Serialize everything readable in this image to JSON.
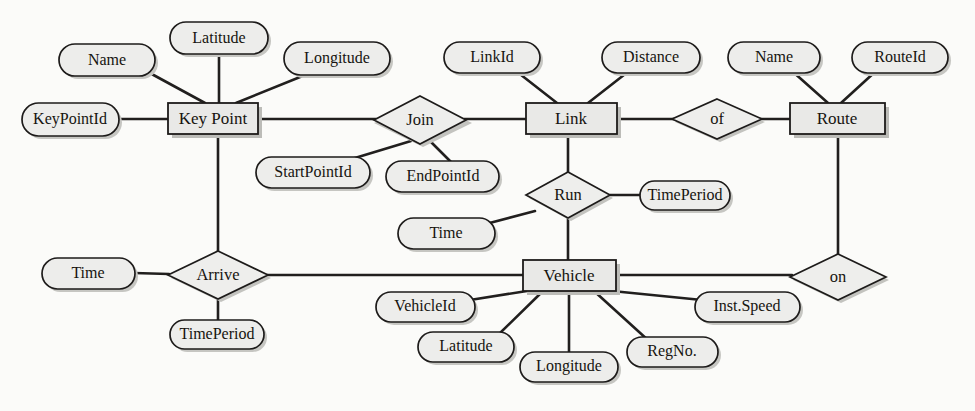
{
  "diagram": {
    "type": "entity-relationship-diagram",
    "title": "",
    "entities": [
      {
        "id": "key_point",
        "label": "Key Point",
        "x": 168,
        "y": 103,
        "w": 90,
        "h": 31
      },
      {
        "id": "link",
        "label": "Link",
        "x": 526,
        "y": 103,
        "w": 91,
        "h": 31
      },
      {
        "id": "route",
        "label": "Route",
        "x": 790,
        "y": 103,
        "w": 95,
        "h": 31
      },
      {
        "id": "vehicle",
        "label": "Vehicle",
        "x": 523,
        "y": 260,
        "w": 93,
        "h": 31
      }
    ],
    "relationships": [
      {
        "id": "join",
        "label": "Join",
        "cx": 420,
        "cy": 120,
        "rx": 46,
        "ry": 24
      },
      {
        "id": "of",
        "label": "of",
        "cx": 717,
        "cy": 119,
        "rx": 45,
        "ry": 20
      },
      {
        "id": "run",
        "label": "Run",
        "cx": 568,
        "cy": 195,
        "rx": 42,
        "ry": 23
      },
      {
        "id": "arrive",
        "label": "Arrive",
        "cx": 218,
        "cy": 275,
        "rx": 50,
        "ry": 24
      },
      {
        "id": "on",
        "label": "on",
        "cx": 838,
        "cy": 277,
        "rx": 48,
        "ry": 23
      }
    ],
    "attributes": [
      {
        "id": "kp_name",
        "label": "Name",
        "owner": "key_point",
        "cx": 107,
        "cy": 60,
        "rx": 48,
        "ry": 16
      },
      {
        "id": "kp_latitude",
        "label": "Latitude",
        "owner": "key_point",
        "cx": 219,
        "cy": 38,
        "rx": 49,
        "ry": 16
      },
      {
        "id": "kp_longitude",
        "label": "Longitude",
        "owner": "key_point",
        "cx": 337,
        "cy": 59,
        "rx": 53,
        "ry": 17
      },
      {
        "id": "kp_keypointid",
        "label": "KeyPointId",
        "owner": "key_point",
        "cx": 70,
        "cy": 119,
        "rx": 49,
        "ry": 17
      },
      {
        "id": "join_startpointid",
        "label": "StartPointId",
        "owner": "join",
        "cx": 313,
        "cy": 173,
        "rx": 57,
        "ry": 16
      },
      {
        "id": "join_endpointid",
        "label": "EndPointId",
        "owner": "join",
        "cx": 443,
        "cy": 177,
        "rx": 57,
        "ry": 16
      },
      {
        "id": "link_linkid",
        "label": "LinkId",
        "owner": "link",
        "cx": 492,
        "cy": 57,
        "rx": 48,
        "ry": 16
      },
      {
        "id": "link_distance",
        "label": "Distance",
        "owner": "link",
        "cx": 651,
        "cy": 57,
        "rx": 49,
        "ry": 16
      },
      {
        "id": "route_name",
        "label": "Name",
        "owner": "route",
        "cx": 774,
        "cy": 57,
        "rx": 46,
        "ry": 16
      },
      {
        "id": "route_routeid",
        "label": "RouteId",
        "owner": "route",
        "cx": 900,
        "cy": 57,
        "rx": 48,
        "ry": 16
      },
      {
        "id": "run_timeperiod",
        "label": "TimePeriod",
        "owner": "run",
        "cx": 685,
        "cy": 196,
        "rx": 45,
        "ry": 15
      },
      {
        "id": "run_time",
        "label": "Time",
        "owner": "run",
        "cx": 446,
        "cy": 233,
        "rx": 48,
        "ry": 16
      },
      {
        "id": "arrive_time",
        "label": "Time",
        "owner": "arrive",
        "cx": 88,
        "cy": 273,
        "rx": 46,
        "ry": 16
      },
      {
        "id": "arrive_timeperiod",
        "label": "TimePeriod",
        "owner": "arrive",
        "cx": 217,
        "cy": 335,
        "rx": 47,
        "ry": 15
      },
      {
        "id": "veh_vehicleid",
        "label": "VehicleId",
        "owner": "vehicle",
        "cx": 425,
        "cy": 307,
        "rx": 49,
        "ry": 15
      },
      {
        "id": "veh_latitude",
        "label": "Latitude",
        "owner": "vehicle",
        "cx": 466,
        "cy": 347,
        "rx": 48,
        "ry": 15
      },
      {
        "id": "veh_longitude",
        "label": "Longitude",
        "owner": "vehicle",
        "cx": 569,
        "cy": 367,
        "rx": 49,
        "ry": 15
      },
      {
        "id": "veh_regno",
        "label": "RegNo.",
        "owner": "vehicle",
        "cx": 672,
        "cy": 352,
        "rx": 45,
        "ry": 15
      },
      {
        "id": "veh_instspeed",
        "label": "Inst.Speed",
        "owner": "vehicle",
        "cx": 747,
        "cy": 307,
        "rx": 52,
        "ry": 15
      }
    ],
    "edges": [
      {
        "id": "e-name-keypoint",
        "from": "kp_name",
        "to": "key_point",
        "points": "148,72 205,103"
      },
      {
        "id": "e-latitude-keypoint",
        "from": "kp_latitude",
        "to": "key_point",
        "points": "219,54 219,103"
      },
      {
        "id": "e-longitude-keypoint",
        "from": "kp_longitude",
        "to": "key_point",
        "points": "310,73 236,103"
      },
      {
        "id": "e-keypointid-keypoint",
        "from": "kp_keypointid",
        "to": "key_point",
        "points": "119,119 168,119"
      },
      {
        "id": "e-keypoint-join",
        "from": "key_point",
        "to": "join",
        "points": "258,119 374,119"
      },
      {
        "id": "e-join-startpointid",
        "from": "join",
        "to": "join_startpointid",
        "points": "410,141 345,161"
      },
      {
        "id": "e-join-endpointid",
        "from": "join",
        "to": "join_endpointid",
        "points": "428,140 450,162"
      },
      {
        "id": "e-join-link",
        "from": "join",
        "to": "link",
        "points": "466,119 526,119"
      },
      {
        "id": "e-linkid-link",
        "from": "link_linkid",
        "to": "link",
        "points": "516,71 557,103"
      },
      {
        "id": "e-distance-link",
        "from": "link_distance",
        "to": "link",
        "points": "629,71 588,103"
      },
      {
        "id": "e-link-of",
        "from": "link",
        "to": "of",
        "points": "617,119 672,119"
      },
      {
        "id": "e-of-route",
        "from": "of",
        "to": "route",
        "points": "762,119 790,119"
      },
      {
        "id": "e-name-route",
        "from": "route_name",
        "to": "route",
        "points": "792,71 828,103"
      },
      {
        "id": "e-routeid-route",
        "from": "route_routeid",
        "to": "route",
        "points": "876,71 841,103"
      },
      {
        "id": "e-link-run",
        "from": "link",
        "to": "run",
        "points": "568,134 568,172"
      },
      {
        "id": "e-run-timeperiod",
        "from": "run",
        "to": "run_timeperiod",
        "points": "610,195 640,195"
      },
      {
        "id": "e-run-time",
        "from": "run",
        "to": "run_time",
        "points": "534,211 480,224"
      },
      {
        "id": "e-run-vehicle",
        "from": "run",
        "to": "vehicle",
        "points": "568,218 568,260"
      },
      {
        "id": "e-keypoint-arrive",
        "from": "key_point",
        "to": "arrive",
        "points": "218,134 218,251"
      },
      {
        "id": "e-time-arrive",
        "from": "arrive_time",
        "to": "arrive",
        "points": "134,273 168,274"
      },
      {
        "id": "e-arrive-timeperiod",
        "from": "arrive",
        "to": "arrive_timeperiod",
        "points": "218,299 218,320"
      },
      {
        "id": "e-arrive-vehicle",
        "from": "arrive",
        "to": "vehicle",
        "points": "268,275 523,275"
      },
      {
        "id": "e-vehicle-vehicleid",
        "from": "vehicle",
        "to": "veh_vehicleid",
        "points": "527,291 469,300"
      },
      {
        "id": "e-vehicle-latitude",
        "from": "vehicle",
        "to": "veh_latitude",
        "points": "543,291 497,334"
      },
      {
        "id": "e-vehicle-longitude",
        "from": "vehicle",
        "to": "veh_longitude",
        "points": "569,291 569,352"
      },
      {
        "id": "e-vehicle-regno",
        "from": "vehicle",
        "to": "veh_regno",
        "points": "594,291 648,340"
      },
      {
        "id": "e-vehicle-instspeed",
        "from": "vehicle",
        "to": "veh_instspeed",
        "points": "612,291 703,299"
      },
      {
        "id": "e-vehicle-on",
        "from": "vehicle",
        "to": "on",
        "points": "616,275 790,275"
      },
      {
        "id": "e-route-on",
        "from": "route",
        "to": "on",
        "points": "838,134 838,254"
      }
    ],
    "colors": {
      "background": "#fbfbf9",
      "shape_fill": "#ededeb",
      "entity_fill": "#e9e9e7",
      "stroke": "#1d1b1a",
      "edge": "#211f1e",
      "shadow": "#c3c3bf",
      "text": "#16140f"
    }
  },
  "bleed_through": [
    {
      "id": "bleed-1",
      "text": "นิน",
      "x": 60,
      "y": 152
    },
    {
      "id": "bleed-2",
      "text": "นี",
      "x": 300,
      "y": 152
    },
    {
      "id": "bleed-3",
      "text": "นีย",
      "x": 430,
      "y": 200
    }
  ]
}
